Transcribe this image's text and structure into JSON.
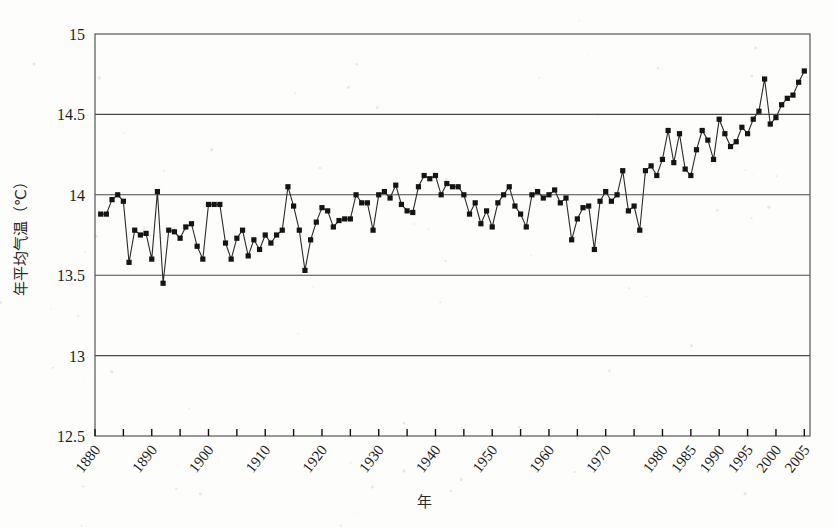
{
  "figure": {
    "background_color": "#fdfdfc",
    "frame_color": "#555555",
    "grid_color": "#4a4a4a",
    "line_color": "#2b2b2b",
    "marker_color": "#141414"
  },
  "axes": {
    "y_title": "年平均气温（℃）",
    "x_title": "年",
    "y_ticks": [
      "12.5",
      "13",
      "13.5",
      "14",
      "14.5",
      "15"
    ],
    "x_ticks": [
      "1880",
      "1890",
      "1900",
      "1910",
      "1920",
      "1930",
      "1940",
      "1950",
      "1960",
      "1970",
      "1980",
      "1985",
      "1990",
      "1995",
      "2000",
      "2005"
    ]
  },
  "chart_data": {
    "type": "line",
    "title": "",
    "xlabel": "年",
    "ylabel": "年平均气温（℃）",
    "xlim": [
      1880,
      2006
    ],
    "ylim": [
      12.5,
      15
    ],
    "ytick_step": 0.5,
    "grid": "horizontal",
    "legend": "none",
    "marker": "filled-square",
    "series": [
      {
        "name": "年平均气温",
        "x": [
          1881,
          1882,
          1883,
          1884,
          1885,
          1886,
          1887,
          1888,
          1889,
          1890,
          1891,
          1892,
          1893,
          1894,
          1895,
          1896,
          1897,
          1898,
          1899,
          1900,
          1901,
          1902,
          1903,
          1904,
          1905,
          1906,
          1907,
          1908,
          1909,
          1910,
          1911,
          1912,
          1913,
          1914,
          1915,
          1916,
          1917,
          1918,
          1919,
          1920,
          1921,
          1922,
          1923,
          1924,
          1925,
          1926,
          1927,
          1928,
          1929,
          1930,
          1931,
          1932,
          1933,
          1934,
          1935,
          1936,
          1937,
          1938,
          1939,
          1940,
          1941,
          1942,
          1943,
          1944,
          1945,
          1946,
          1947,
          1948,
          1949,
          1950,
          1951,
          1952,
          1953,
          1954,
          1955,
          1956,
          1957,
          1958,
          1959,
          1960,
          1961,
          1962,
          1963,
          1964,
          1965,
          1966,
          1967,
          1968,
          1969,
          1970,
          1971,
          1972,
          1973,
          1974,
          1975,
          1976,
          1977,
          1978,
          1979,
          1980,
          1981,
          1982,
          1983,
          1984,
          1985,
          1986,
          1987,
          1988,
          1989,
          1990,
          1991,
          1992,
          1993,
          1994,
          1995,
          1996,
          1997,
          1998,
          1999,
          2000,
          2001,
          2002,
          2003,
          2004,
          2005
        ],
        "values": [
          13.88,
          13.88,
          13.97,
          14.0,
          13.96,
          13.58,
          13.78,
          13.75,
          13.76,
          13.6,
          14.02,
          13.45,
          13.78,
          13.77,
          13.73,
          13.8,
          13.82,
          13.68,
          13.6,
          13.94,
          13.94,
          13.94,
          13.7,
          13.6,
          13.73,
          13.78,
          13.62,
          13.72,
          13.66,
          13.75,
          13.7,
          13.75,
          13.78,
          14.05,
          13.93,
          13.78,
          13.53,
          13.72,
          13.83,
          13.92,
          13.9,
          13.8,
          13.84,
          13.85,
          13.85,
          14.0,
          13.95,
          13.95,
          13.78,
          14.0,
          14.02,
          13.98,
          14.06,
          13.94,
          13.9,
          13.89,
          14.05,
          14.12,
          14.1,
          14.12,
          14.0,
          14.07,
          14.05,
          14.05,
          14.0,
          13.88,
          13.95,
          13.82,
          13.9,
          13.8,
          13.95,
          14.0,
          14.05,
          13.93,
          13.88,
          13.8,
          14.0,
          14.02,
          13.98,
          14.0,
          14.03,
          13.95,
          13.98,
          13.72,
          13.85,
          13.92,
          13.93,
          13.66,
          13.96,
          14.02,
          13.96,
          14.0,
          14.15,
          13.9,
          13.93,
          13.78,
          14.15,
          14.18,
          14.12,
          14.22,
          14.4,
          14.2,
          14.38,
          14.16,
          14.12,
          14.28,
          14.4,
          14.34,
          14.22,
          14.47,
          14.38,
          14.3,
          14.33,
          14.42,
          14.38,
          14.47,
          14.52,
          14.72,
          14.44,
          14.48,
          14.56,
          14.6,
          14.62,
          14.7,
          14.77
        ]
      }
    ]
  }
}
